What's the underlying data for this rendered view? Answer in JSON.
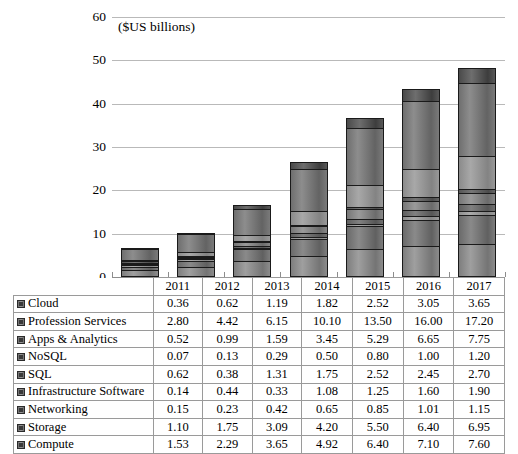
{
  "chart_data": {
    "type": "bar",
    "subtype": "stacked-column",
    "title": "($US billions)",
    "xlabel": "",
    "ylabel": "",
    "ylim": [
      0,
      60
    ],
    "yticks": [
      0,
      10,
      20,
      30,
      40,
      50,
      60
    ],
    "grid": true,
    "legend_position": "table-left-column",
    "categories": [
      "2011",
      "2012",
      "2013",
      "2014",
      "2015",
      "2016",
      "2017"
    ],
    "series": [
      {
        "name": "Cloud",
        "values": [
          0.36,
          0.62,
          1.19,
          1.82,
          2.52,
          3.05,
          3.65
        ]
      },
      {
        "name": "Profession Services",
        "values": [
          2.8,
          4.42,
          6.15,
          10.1,
          13.5,
          16.0,
          17.2
        ]
      },
      {
        "name": "Apps & Analytics",
        "values": [
          0.52,
          0.99,
          1.59,
          3.45,
          5.29,
          6.65,
          7.75
        ]
      },
      {
        "name": "NoSQL",
        "values": [
          0.07,
          0.13,
          0.29,
          0.5,
          0.8,
          1.0,
          1.2
        ]
      },
      {
        "name": "SQL",
        "values": [
          0.62,
          0.38,
          1.31,
          1.75,
          2.52,
          2.45,
          2.7
        ]
      },
      {
        "name": "Infrastructure Software",
        "values": [
          0.14,
          0.44,
          0.33,
          1.08,
          1.25,
          1.6,
          1.9
        ]
      },
      {
        "name": "Networking",
        "values": [
          0.15,
          0.23,
          0.42,
          0.65,
          0.85,
          1.01,
          1.15
        ]
      },
      {
        "name": "Storage",
        "values": [
          1.1,
          1.75,
          3.09,
          4.2,
          5.5,
          6.4,
          6.95
        ]
      },
      {
        "name": "Compute",
        "values": [
          1.53,
          2.29,
          3.65,
          4.92,
          6.4,
          7.1,
          7.6
        ]
      }
    ],
    "totals": [
      7.29,
      11.25,
      18.02,
      28.47,
      38.63,
      45.26,
      50.1
    ]
  },
  "table": {
    "corner_label": "",
    "column_headers": [
      "2011",
      "2012",
      "2013",
      "2014",
      "2015",
      "2016",
      "2017"
    ]
  },
  "axis": {
    "ytick_labels": [
      "60",
      "50",
      "40",
      "30",
      "20",
      "10",
      "0"
    ]
  }
}
